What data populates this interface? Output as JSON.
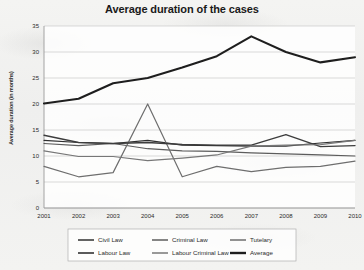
{
  "chart_data": {
    "type": "line",
    "title": "Average duration of the cases",
    "xlabel": "",
    "ylabel": "Average duration  (in months)",
    "categories": [
      "2001",
      "2002",
      "2003",
      "2004",
      "2005",
      "2006",
      "2007",
      "2008",
      "2009",
      "2010"
    ],
    "x": [
      2001,
      2002,
      2003,
      2004,
      2005,
      2006,
      2007,
      2008,
      2009,
      2010
    ],
    "ylim": [
      0,
      35
    ],
    "yticks": [
      0,
      5,
      10,
      15,
      20,
      25,
      30,
      35
    ],
    "grid": true,
    "legend_position": "bottom",
    "series": [
      {
        "name": "Civil Law",
        "values": [
          13.0,
          12.6,
          12.4,
          13.0,
          12.1,
          12.0,
          11.9,
          11.9,
          12.5,
          13.0
        ]
      },
      {
        "name": "Criminal Law",
        "values": [
          12.4,
          12.0,
          12.4,
          11.4,
          11.0,
          10.9,
          10.6,
          10.4,
          10.2,
          10.0
        ]
      },
      {
        "name": "Tutelary",
        "values": [
          8.0,
          6.0,
          6.8,
          20.0,
          6.0,
          8.0,
          7.0,
          7.8,
          8.0,
          9.0
        ]
      },
      {
        "name": "Labour Law",
        "values": [
          14.0,
          12.6,
          12.4,
          12.6,
          12.2,
          12.1,
          12.1,
          14.1,
          11.8,
          12.0
        ]
      },
      {
        "name": "Labour Criminal Law",
        "values": [
          11.0,
          9.9,
          9.9,
          9.1,
          9.6,
          10.2,
          11.9,
          12.1,
          12.2,
          13.0
        ]
      },
      {
        "name": "Average",
        "values": [
          20.1,
          21.0,
          24.0,
          25.0,
          27.0,
          29.2,
          33.0,
          30.0,
          28.0,
          29.0
        ]
      }
    ],
    "series_styles": [
      {
        "name": "Civil Law",
        "color": "#2f2f2f",
        "width": 1.2
      },
      {
        "name": "Criminal Law",
        "color": "#5c5c5c",
        "width": 1.2
      },
      {
        "name": "Tutelary",
        "color": "#6e6e6e",
        "width": 1.2
      },
      {
        "name": "Labour Law",
        "color": "#3d3d3d",
        "width": 1.4
      },
      {
        "name": "Labour Criminal Law",
        "color": "#777777",
        "width": 1.2
      },
      {
        "name": "Average",
        "color": "#1e1e1e",
        "width": 2.1
      }
    ],
    "colors": {
      "plot_background": "#ffffff",
      "gridline": "#c9c9c9",
      "axis": "#9a9a9a",
      "text": "#2b2b2b",
      "legend_border": "#b0b0b0"
    }
  }
}
